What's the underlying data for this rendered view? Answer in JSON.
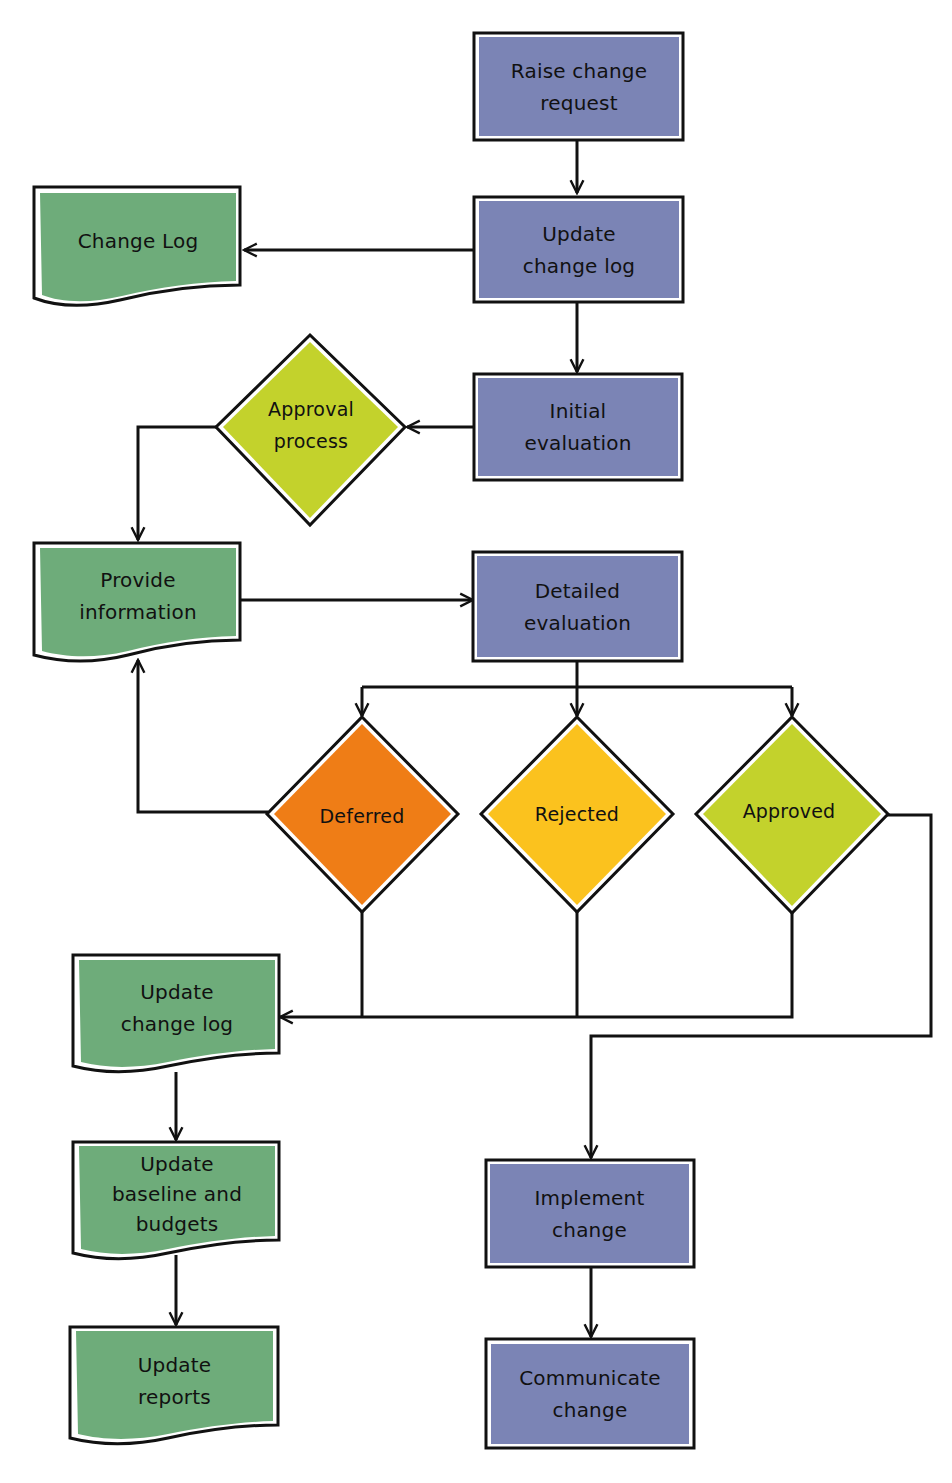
{
  "diagram": {
    "type": "flowchart",
    "title": "",
    "colors": {
      "process": "#7b84b5",
      "document": "#6eac7a",
      "approval_process": "#c3d22c",
      "deferred": "#ef7d16",
      "rejected": "#fbc21e",
      "approved": "#c3d22c",
      "line": "#111111"
    },
    "nodes": {
      "raise_change_request": {
        "label": "Raise change\nrequest",
        "shape": "process"
      },
      "update_change_log_top": {
        "label": "Update\nchange log",
        "shape": "process"
      },
      "change_log": {
        "label": "Change Log",
        "shape": "document"
      },
      "initial_evaluation": {
        "label": "Initial\nevaluation",
        "shape": "process"
      },
      "approval_process": {
        "label": "Approval\nprocess",
        "shape": "decision"
      },
      "provide_information": {
        "label": "Provide\ninformation",
        "shape": "document"
      },
      "detailed_evaluation": {
        "label": "Detailed\nevaluation",
        "shape": "process"
      },
      "deferred": {
        "label": "Deferred",
        "shape": "decision"
      },
      "rejected": {
        "label": "Rejected",
        "shape": "decision"
      },
      "approved": {
        "label": "Approved",
        "shape": "decision"
      },
      "update_change_log_bottom": {
        "label": "Update\nchange log",
        "shape": "document"
      },
      "update_baseline_budgets": {
        "label": "Update\nbaseline and\nbudgets",
        "shape": "document"
      },
      "update_reports": {
        "label": "Update\nreports",
        "shape": "document"
      },
      "implement_change": {
        "label": "Implement\nchange",
        "shape": "process"
      },
      "communicate_change": {
        "label": "Communicate\nchange",
        "shape": "process"
      }
    },
    "edges": [
      {
        "from": "raise_change_request",
        "to": "update_change_log_top"
      },
      {
        "from": "update_change_log_top",
        "to": "change_log"
      },
      {
        "from": "update_change_log_top",
        "to": "initial_evaluation"
      },
      {
        "from": "initial_evaluation",
        "to": "approval_process"
      },
      {
        "from": "approval_process",
        "to": "provide_information"
      },
      {
        "from": "provide_information",
        "to": "detailed_evaluation"
      },
      {
        "from": "detailed_evaluation",
        "to": "deferred"
      },
      {
        "from": "detailed_evaluation",
        "to": "rejected"
      },
      {
        "from": "detailed_evaluation",
        "to": "approved"
      },
      {
        "from": "deferred",
        "to": "provide_information"
      },
      {
        "from": "deferred",
        "to": "update_change_log_bottom"
      },
      {
        "from": "rejected",
        "to": "update_change_log_bottom"
      },
      {
        "from": "approved",
        "to": "update_change_log_bottom"
      },
      {
        "from": "approved",
        "to": "implement_change"
      },
      {
        "from": "update_change_log_bottom",
        "to": "update_baseline_budgets"
      },
      {
        "from": "update_baseline_budgets",
        "to": "update_reports"
      },
      {
        "from": "implement_change",
        "to": "communicate_change"
      }
    ]
  }
}
